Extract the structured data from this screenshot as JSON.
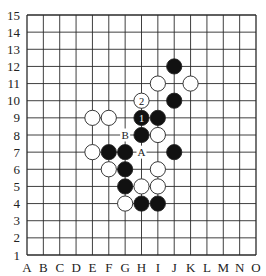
{
  "board": {
    "size": 15,
    "columns": [
      "A",
      "B",
      "C",
      "D",
      "E",
      "F",
      "G",
      "H",
      "I",
      "J",
      "K",
      "L",
      "M",
      "N",
      "O"
    ],
    "rows": [
      "15",
      "14",
      "13",
      "12",
      "11",
      "10",
      "9",
      "8",
      "7",
      "6",
      "5",
      "4",
      "3",
      "2",
      "1"
    ],
    "colors": {
      "line": "#2a2a2a",
      "black_stone": "#111111",
      "white_stone": "#ffffff",
      "stone_outline": "#222222",
      "background": "#ffffff"
    }
  },
  "stones": [
    {
      "color": "black",
      "col": "J",
      "row": 12
    },
    {
      "color": "white",
      "col": "I",
      "row": 11
    },
    {
      "color": "white",
      "col": "K",
      "row": 11
    },
    {
      "color": "black",
      "col": "J",
      "row": 10
    },
    {
      "color": "white",
      "col": "H",
      "row": 10,
      "label": "2"
    },
    {
      "color": "white",
      "col": "E",
      "row": 9
    },
    {
      "color": "white",
      "col": "F",
      "row": 9
    },
    {
      "color": "black",
      "col": "H",
      "row": 9,
      "label": "1"
    },
    {
      "color": "black",
      "col": "I",
      "row": 9
    },
    {
      "color": "black",
      "col": "H",
      "row": 8
    },
    {
      "color": "white",
      "col": "I",
      "row": 8
    },
    {
      "color": "white",
      "col": "E",
      "row": 7
    },
    {
      "color": "black",
      "col": "F",
      "row": 7
    },
    {
      "color": "black",
      "col": "G",
      "row": 7
    },
    {
      "color": "black",
      "col": "J",
      "row": 7
    },
    {
      "color": "white",
      "col": "F",
      "row": 6
    },
    {
      "color": "black",
      "col": "G",
      "row": 6
    },
    {
      "color": "white",
      "col": "I",
      "row": 6
    },
    {
      "color": "black",
      "col": "G",
      "row": 5
    },
    {
      "color": "white",
      "col": "H",
      "row": 5
    },
    {
      "color": "white",
      "col": "I",
      "row": 5
    },
    {
      "color": "white",
      "col": "G",
      "row": 4
    },
    {
      "color": "black",
      "col": "H",
      "row": 4
    },
    {
      "color": "black",
      "col": "I",
      "row": 4
    }
  ],
  "markers": [
    {
      "text": "A",
      "col": "H",
      "row": 7
    },
    {
      "text": "B",
      "col": "G",
      "row": 8
    }
  ]
}
